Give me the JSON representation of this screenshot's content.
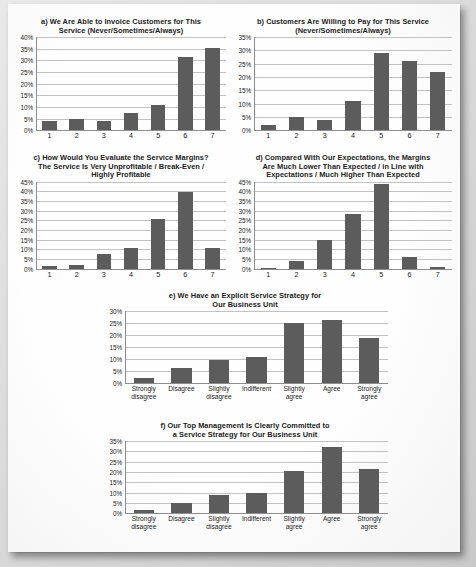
{
  "document": {
    "kind": "scanned-figure-page",
    "panel_count": 6
  },
  "chart_data": [
    {
      "id": "a",
      "type": "bar",
      "title": "a) We Are Able to Invoice Customers for This\nService (Never/Sometimes/Always)",
      "categories": [
        "1",
        "2",
        "3",
        "4",
        "5",
        "6",
        "7"
      ],
      "values": [
        4,
        5,
        4,
        7.5,
        11,
        31.5,
        35.5
      ],
      "ylabel": "",
      "xlabel": "",
      "ylim": [
        0,
        40
      ],
      "ytick_step": 5,
      "yticks": [
        "0%",
        "5%",
        "10%",
        "15%",
        "20%",
        "25%",
        "30%",
        "35%",
        "40%"
      ],
      "grid": true,
      "legend": "none"
    },
    {
      "id": "b",
      "type": "bar",
      "title": "b) Customers Are Willing to Pay for This Service\n(Never/Sometimes/Always)",
      "categories": [
        "1",
        "2",
        "3",
        "4",
        "5",
        "6",
        "7"
      ],
      "values": [
        2,
        5,
        4,
        11,
        29,
        26,
        22
      ],
      "ylabel": "",
      "xlabel": "",
      "ylim": [
        0,
        35
      ],
      "ytick_step": 5,
      "yticks": [
        "0%",
        "5%",
        "10%",
        "15%",
        "20%",
        "25%",
        "30%",
        "35%"
      ],
      "grid": true,
      "legend": "none"
    },
    {
      "id": "c",
      "type": "bar",
      "title": "c) How Would You Evaluate the Service Margins?\nThe Service Is Very Unprofitable / Break-Even /\nHighly Profitable",
      "categories": [
        "1",
        "2",
        "3",
        "4",
        "5",
        "6",
        "7"
      ],
      "values": [
        1.5,
        2,
        7.5,
        10.5,
        25.5,
        39.5,
        11
      ],
      "ylabel": "",
      "xlabel": "",
      "ylim": [
        0,
        45
      ],
      "ytick_step": 5,
      "yticks": [
        "0%",
        "5%",
        "10%",
        "15%",
        "20%",
        "25%",
        "30%",
        "35%",
        "40%",
        "45%"
      ],
      "grid": true,
      "legend": "none"
    },
    {
      "id": "d",
      "type": "bar",
      "title": "d) Compared With Our Expectations, the Margins\nAre Much Lower Than Expected / in Line with\nExpectations / Much Higher Than Expected",
      "categories": [
        "1",
        "2",
        "3",
        "4",
        "5",
        "6",
        "7"
      ],
      "values": [
        0.5,
        4,
        15,
        28.5,
        44,
        6,
        1
      ],
      "ylabel": "",
      "xlabel": "",
      "ylim": [
        0,
        45
      ],
      "ytick_step": 5,
      "yticks": [
        "0%",
        "5%",
        "10%",
        "15%",
        "20%",
        "25%",
        "30%",
        "35%",
        "40%",
        "45%"
      ],
      "grid": true,
      "legend": "none"
    },
    {
      "id": "e",
      "type": "bar",
      "title": "e) We Have an Explicit Service Strategy for\nOur Business Unit",
      "categories": [
        "Strongly\ndisagree",
        "Disagree",
        "Slightly\ndisagree",
        "Indifferent",
        "Slightly\nagree",
        "Agree",
        "Strongly\nagree"
      ],
      "values": [
        2,
        6.2,
        9.5,
        11,
        25,
        26.5,
        18.8
      ],
      "ylabel": "",
      "xlabel": "",
      "ylim": [
        0,
        30
      ],
      "ytick_step": 5,
      "yticks": [
        "0%",
        "5%",
        "10%",
        "15%",
        "20%",
        "25%",
        "30%"
      ],
      "grid": true,
      "legend": "none"
    },
    {
      "id": "f",
      "type": "bar",
      "title": "f) Our Top Management Is Clearly Committed to\na Service Strategy for Our Business Unit",
      "categories": [
        "Strongly\ndisagree",
        "Disagree",
        "Slightly\ndisagree",
        "Indifferent",
        "Slightly\nagree",
        "Agree",
        "Strongly\nagree"
      ],
      "values": [
        1.5,
        5.2,
        8.8,
        10,
        20.5,
        32,
        21.4
      ],
      "ylabel": "",
      "xlabel": "",
      "ylim": [
        0,
        35
      ],
      "ytick_step": 5,
      "yticks": [
        "0%",
        "5%",
        "10%",
        "15%",
        "20%",
        "25%",
        "30%",
        "35%"
      ],
      "grid": true,
      "legend": "none"
    }
  ],
  "colors": {
    "bar": "#5c5c5c",
    "gridline": "#c2c2c2",
    "axis": "#8d8d8d",
    "text": "#1b1b1b",
    "page": "#fefefe"
  }
}
